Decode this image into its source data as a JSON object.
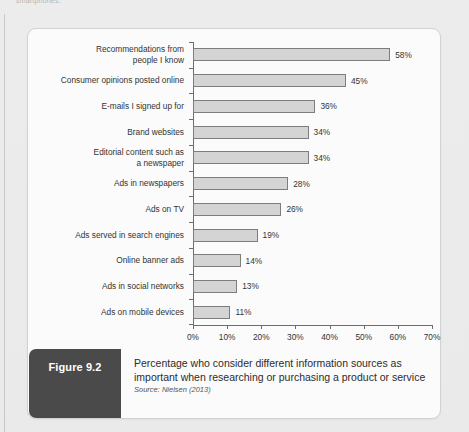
{
  "page": {
    "top_fragment": "smartphones."
  },
  "figure": {
    "badge_label": "Figure 9.2",
    "caption": "Percentage who consider different information sources as important when researching or purchasing a product or service",
    "source": "Source: Nielsen (2013)"
  },
  "chart_data": {
    "type": "bar",
    "orientation": "horizontal",
    "title": "",
    "xlabel": "",
    "ylabel": "",
    "xlim": [
      0,
      70
    ],
    "grid": false,
    "legend": null,
    "bar_color": "#d4d4d4",
    "bar_border_color": "#7d7d7d",
    "tick_labels": [
      "0%",
      "10%",
      "20%",
      "30%",
      "40%",
      "50%",
      "60%",
      "70%"
    ],
    "tick_values": [
      0,
      10,
      20,
      30,
      40,
      50,
      60,
      70
    ],
    "categories": [
      "Recommendations from\npeople I know",
      "Consumer opinions posted online",
      "E-mails I signed up for",
      "Brand websites",
      "Editorial content such as\na newspaper",
      "Ads in newspapers",
      "Ads on TV",
      "Ads served in search engines",
      "Online banner ads",
      "Ads in social networks",
      "Ads on mobile devices"
    ],
    "values": [
      58,
      45,
      36,
      34,
      34,
      28,
      26,
      19,
      14,
      13,
      11
    ],
    "value_labels": [
      "58%",
      "45%",
      "36%",
      "34%",
      "34%",
      "28%",
      "26%",
      "19%",
      "14%",
      "13%",
      "11%"
    ]
  }
}
